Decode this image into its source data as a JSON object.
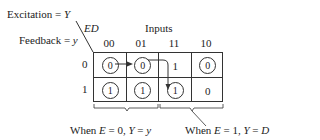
{
  "labels": {
    "excitation": "Excitation = ",
    "excitation_var": "Y",
    "feedback": "Feedback = ",
    "feedback_var": "y",
    "corner": "ED",
    "inputs": "Inputs"
  },
  "columns": [
    "00",
    "01",
    "11",
    "10"
  ],
  "rows": [
    "0",
    "1"
  ],
  "cells": [
    [
      {
        "value": "0",
        "circled": true
      },
      {
        "value": "0",
        "circled": true
      },
      {
        "value": "1",
        "circled": false
      },
      {
        "value": "0",
        "circled": true
      }
    ],
    [
      {
        "value": "1",
        "circled": true
      },
      {
        "value": "1",
        "circled": true
      },
      {
        "value": "1",
        "circled": true
      },
      {
        "value": "0",
        "circled": false
      }
    ]
  ],
  "annotations": {
    "left": {
      "prefix": "When ",
      "e": "E",
      "eq1": " = 0, ",
      "y": "Y",
      "eq2": " = ",
      "val": "y"
    },
    "right": {
      "prefix": "When ",
      "e": "E",
      "eq1": " = 1, ",
      "y": "Y",
      "eq2": " = ",
      "val": "D"
    }
  }
}
